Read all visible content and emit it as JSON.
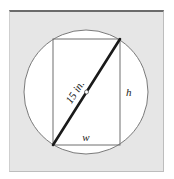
{
  "diagram": {
    "diagonal_label": "15 in.",
    "height_label": "h",
    "width_label": "w",
    "colors": {
      "background": "#e6e6e6",
      "circle_fill": "#ffffff",
      "circle_stroke": "#7a7a7a",
      "rect_stroke": "#6e6e6e",
      "diagonal": "#1a1a1a",
      "frame_top": "#6b6b6b"
    }
  }
}
